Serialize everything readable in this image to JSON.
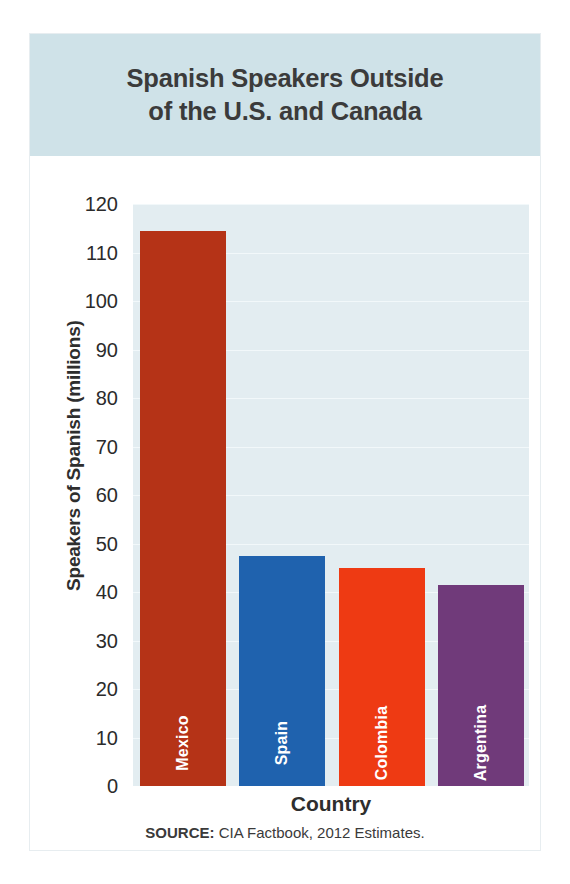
{
  "chart_data": {
    "type": "bar",
    "title": "Spanish Speakers Outside of the U.S. and Canada",
    "title_line1": "Spanish Speakers Outside",
    "title_line2": "of the U.S. and Canada",
    "categories": [
      "Mexico",
      "Spain",
      "Colombia",
      "Argentina"
    ],
    "values": [
      114.5,
      47.5,
      45,
      41.5
    ],
    "series": [
      {
        "name": "Speakers of Spanish (millions)",
        "values": [
          114.5,
          47.5,
          45,
          41.5
        ]
      }
    ],
    "bar_colors": [
      "#b53317",
      "#1f62ae",
      "#ee3a13",
      "#703a7a"
    ],
    "xlabel": "Country",
    "ylabel": "Speakers of Spanish (millions)",
    "ylim": [
      0,
      120
    ],
    "ytick_step": 10,
    "yticks": [
      "0",
      "10",
      "20",
      "30",
      "40",
      "50",
      "60",
      "70",
      "80",
      "90",
      "100",
      "110",
      "120"
    ],
    "grid": true,
    "grid_axis": "y",
    "legend": "none",
    "bar_label_position": "inside-bottom-rotated",
    "plot_background": "#e3edf1",
    "title_band_color": "#cfe2e8",
    "figure_background": "#ffffff"
  },
  "source": {
    "prefix": "SOURCE:",
    "text": "CIA Factbook, 2012 Estimates."
  }
}
